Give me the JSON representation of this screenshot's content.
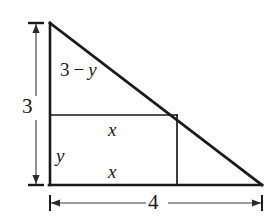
{
  "figure": {
    "kind": "geometry-diagram",
    "background_color": "#ffffff",
    "stroke_color": "#1a1a1a",
    "labels": {
      "height_dimension": "3",
      "base_dimension": "4",
      "upper_left_side_prefix": "3",
      "upper_left_side_operator": "−",
      "upper_left_side_variable": "y",
      "rect_top": "x",
      "rect_bottom": "x",
      "rect_left": "y"
    },
    "geometry": {
      "triangle": {
        "apex": [
          50,
          23
        ],
        "right_angle_corner": [
          50,
          185
        ],
        "base_right": [
          262,
          185
        ],
        "vertical_leg_length_label": "3",
        "horizontal_leg_length_label": "4"
      },
      "rectangle": {
        "left": 50,
        "top": 115,
        "right": 177,
        "bottom": 185,
        "width_label": "x",
        "height_label": "y"
      },
      "height_dimension_line": {
        "x": 36,
        "y_top": 23,
        "y_bottom": 185
      },
      "base_dimension_line": {
        "y": 203,
        "x_left": 50,
        "x_right": 262
      }
    }
  }
}
